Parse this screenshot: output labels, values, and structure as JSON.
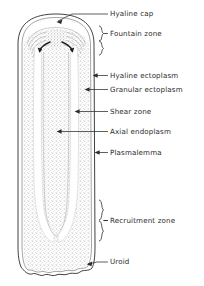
{
  "figure": {
    "background_color": "#ffffff",
    "ink_color": "#2b2b2b",
    "stipple_color": "#a8a8a8"
  },
  "cell": {
    "outline_color": "#2b2b2b",
    "granular_fill": "stipple",
    "hyaline_fill": "#ffffff",
    "uroid_edge": "scalloped"
  },
  "labels": [
    {
      "id": "hyaline-cap",
      "text": "Hyaline cap",
      "x": 110,
      "y": 11,
      "connector": "arrow"
    },
    {
      "id": "fountain-zone",
      "text": "Fountain zone",
      "x": 114,
      "y": 34,
      "connector": "brace"
    },
    {
      "id": "hyaline-ectoplasm",
      "text": "Hyaline ectoplasm",
      "x": 110,
      "y": 73,
      "connector": "arrow"
    },
    {
      "id": "granular-ectoplasm",
      "text": "Granular ectoplasm",
      "x": 110,
      "y": 87,
      "connector": "arrow"
    },
    {
      "id": "shear-zone",
      "text": "Shear zone",
      "x": 110,
      "y": 109,
      "connector": "arrow"
    },
    {
      "id": "axial-endoplasm",
      "text": "Axial endoplasm",
      "x": 110,
      "y": 129,
      "connector": "arrow"
    },
    {
      "id": "plasmalemma",
      "text": "Plasmalemma",
      "x": 110,
      "y": 150,
      "connector": "arrow"
    },
    {
      "id": "recruitment-zone",
      "text": "Recruitment zone",
      "x": 114,
      "y": 218,
      "connector": "brace"
    },
    {
      "id": "uroid",
      "text": "Uroid",
      "x": 110,
      "y": 259,
      "connector": "arrow"
    }
  ]
}
